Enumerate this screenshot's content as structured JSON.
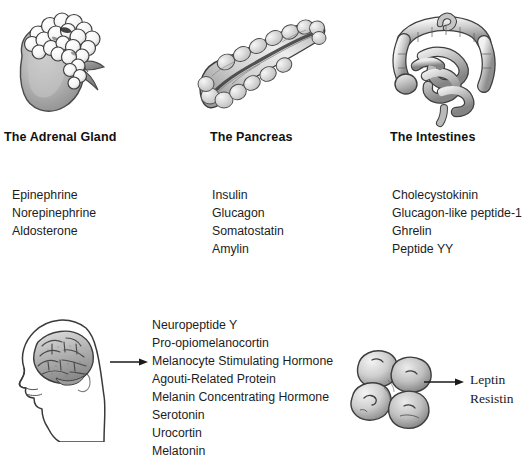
{
  "figure": {
    "background_color": "#ffffff",
    "text_color": "#1a1a1a"
  },
  "panels": {
    "adrenal": {
      "heading": "The Adrenal Gland",
      "figure_name": "adrenal-gland-illustration",
      "hormones": [
        "Epinephrine",
        "Norepinephrine",
        "Aldosterone"
      ]
    },
    "pancreas": {
      "heading": "The Pancreas",
      "figure_name": "pancreas-illustration",
      "hormones": [
        "Insulin",
        "Glucagon",
        "Somatostatin",
        "Amylin"
      ]
    },
    "intestines": {
      "heading": "The Intestines",
      "figure_name": "intestines-illustration",
      "hormones": [
        "Cholecystokinin",
        "Glucagon-like peptide-1",
        "Ghrelin",
        "Peptide YY"
      ]
    },
    "brain": {
      "figure_name": "brain-head-profile-illustration",
      "arrow_name": "brain-to-hormones-arrow",
      "hormones": [
        "Neuropeptide Y",
        "Pro-opiomelanocortin",
        "Melanocyte Stimulating Hormone",
        "Agouti-Related Protein",
        "Melanin Concentrating Hormone",
        "Serotonin",
        "Urocortin",
        "Melatonin"
      ]
    },
    "adipose": {
      "figure_name": "adipocyte-cluster-illustration",
      "arrow_name": "adipose-to-hormones-arrow",
      "hormones": [
        "Leptin",
        "Resistin"
      ]
    }
  }
}
